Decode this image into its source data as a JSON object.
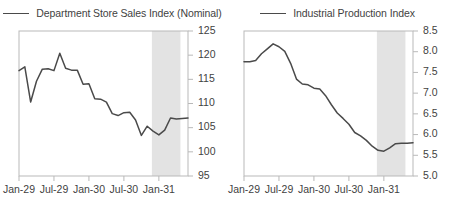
{
  "chart_data": [
    {
      "type": "line",
      "title": "Department Store Sales Index (Nominal)",
      "panel": "left",
      "xlabel": "",
      "ylabel": "",
      "ylim": [
        95,
        125
      ],
      "ytick_values": [
        95,
        100,
        105,
        110,
        115,
        120,
        125
      ],
      "ytick_labels": [
        "95",
        "100",
        "105",
        "110",
        "115",
        "120",
        "125"
      ],
      "yaxis_position": "right",
      "xtick_labels": [
        "Jan-29",
        "Jul-29",
        "Jan-30",
        "Jul-30",
        "Jan-31"
      ],
      "xtick_positions": [
        0,
        6,
        12,
        18,
        24
      ],
      "xlim": [
        0,
        29
      ],
      "grid": false,
      "legend_position": "top-center",
      "legend_entries": [
        "Department Store Sales Index (Nominal)"
      ],
      "line_color": "#4a4a4a",
      "shaded_band": {
        "label": "recession-band",
        "x_start": 22.8,
        "x_end": 27.7,
        "color": "#e3e3e3"
      },
      "x": [
        0,
        1,
        2,
        3,
        4,
        5,
        6,
        7,
        8,
        9,
        10,
        11,
        12,
        13,
        14,
        15,
        16,
        17,
        18,
        19,
        20,
        21,
        22,
        23,
        24,
        25,
        26,
        27,
        28,
        29
      ],
      "values": [
        116.8,
        117.6,
        110.3,
        114.6,
        117.1,
        117.2,
        116.8,
        120.4,
        117.3,
        116.9,
        116.9,
        114.0,
        114.1,
        111.0,
        110.9,
        110.3,
        107.9,
        107.5,
        108.1,
        108.2,
        106.6,
        103.4,
        105.3,
        104.3,
        103.5,
        104.5,
        107.0,
        106.8,
        106.9,
        107.0
      ]
    },
    {
      "type": "line",
      "title": "Industrial Production Index",
      "panel": "right",
      "xlabel": "",
      "ylabel": "",
      "ylim": [
        5.0,
        8.5
      ],
      "ytick_values": [
        5.0,
        5.5,
        6.0,
        6.5,
        7.0,
        7.5,
        8.0,
        8.5
      ],
      "ytick_labels": [
        "5.0",
        "5.5",
        "6.0",
        "6.5",
        "7.0",
        "7.5",
        "8.0",
        "8.5"
      ],
      "yaxis_position": "right",
      "xtick_labels": [
        "Jan-29",
        "Jul-29",
        "Jan-30",
        "Jul-30",
        "Jan-31"
      ],
      "xtick_positions": [
        0,
        6,
        12,
        18,
        24
      ],
      "xlim": [
        0,
        29
      ],
      "grid": false,
      "legend_position": "top-center",
      "legend_entries": [
        "Industrial Production Index"
      ],
      "line_color": "#4a4a4a",
      "shaded_band": {
        "label": "recession-band",
        "x_start": 22.8,
        "x_end": 27.7,
        "color": "#e3e3e3"
      },
      "x": [
        0,
        1,
        2,
        3,
        4,
        5,
        6,
        7,
        8,
        9,
        10,
        11,
        12,
        13,
        14,
        15,
        16,
        17,
        18,
        19,
        20,
        21,
        22,
        23,
        24,
        25,
        26,
        27,
        28,
        29
      ],
      "values": [
        7.76,
        7.76,
        7.79,
        7.95,
        8.07,
        8.19,
        8.12,
        8.01,
        7.72,
        7.34,
        7.22,
        7.2,
        7.12,
        7.1,
        6.94,
        6.72,
        6.52,
        6.39,
        6.25,
        6.05,
        5.97,
        5.86,
        5.72,
        5.62,
        5.6,
        5.68,
        5.78,
        5.79,
        5.79,
        5.8
      ]
    }
  ]
}
